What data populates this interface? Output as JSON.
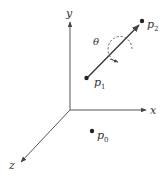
{
  "diagram": {
    "axes": {
      "x_label": "x",
      "y_label": "y",
      "z_label": "z"
    },
    "points": {
      "p0": {
        "base": "p",
        "sub": "0"
      },
      "p1": {
        "base": "p",
        "sub": "1"
      },
      "p2": {
        "base": "p",
        "sub": "2"
      }
    },
    "angle_label": "θ",
    "colors": {
      "line": "#444444",
      "text": "#333333",
      "background": "#ffffff"
    }
  }
}
